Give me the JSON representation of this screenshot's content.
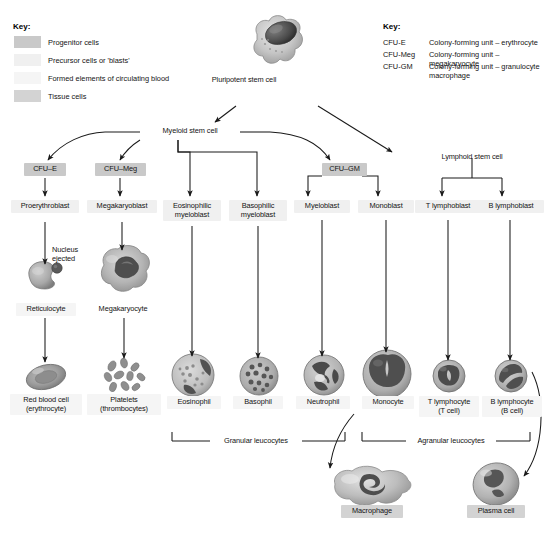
{
  "key_left": {
    "title": "Key:",
    "items": [
      {
        "label": "Progenitor cells",
        "color": "#c9c9c9",
        "swatch": "progenitor-swatch"
      },
      {
        "label": "Precursor cells or 'blasts'",
        "color": "#f0f0f0",
        "swatch": "precursor-swatch"
      },
      {
        "label": "Formed elements of circulating blood",
        "color": "#f5f5f5",
        "swatch": "formed-elements-swatch"
      },
      {
        "label": "Tissue cells",
        "color": "#d3d3d3",
        "swatch": "tissue-swatch"
      }
    ]
  },
  "key_right": {
    "title": "Key:",
    "items": [
      {
        "abbr": "CFU-E",
        "definition": "Colony-forming unit – erythrocyte"
      },
      {
        "abbr": "CFU-Meg",
        "definition": "Colony-forming unit – megakaryocyte"
      },
      {
        "abbr": "CFU-GM",
        "definition": "Colony-forming unit – granulocyte\nmacrophage"
      }
    ]
  },
  "nodes": {
    "pluripotent": "Pluripotent stem cell",
    "myeloid": "Myeloid stem cell",
    "lymphoid": "Lymphoid stem cell",
    "cfu_e": "CFU–E",
    "cfu_meg": "CFU–Meg",
    "cfu_gm": "CFU–GM",
    "proerythroblast": "Proerythroblast",
    "megakaryoblast": "Megakaryoblast",
    "eosinophilic_myeloblast": "Eosinophilic\nmyeloblast",
    "basophilic_myeloblast": "Basophilic\nmyeloblast",
    "myeloblast": "Myeloblast",
    "monoblast": "Monoblast",
    "t_lymphoblast": "T lymphoblast",
    "b_lymphoblast": "B lymphoblast",
    "nucleus_ejected": "Nucleus\nejected",
    "reticulocyte": "Reticulocyte",
    "megakaryocyte": "Megakaryocyte",
    "red_blood_cell": "Red blood cell\n(erythrocyte)",
    "platelets": "Platelets\n(thrombocytes)",
    "eosinophil": "Eosinophil",
    "basophil": "Basophil",
    "neutrophil": "Neutrophil",
    "monocyte": "Monocyte",
    "t_lymphocyte": "T lymphocyte\n(T cell)",
    "b_lymphocyte": "B lymphocyte\n(B cell)",
    "macrophage": "Macrophage",
    "plasma_cell": "Plasma cell"
  },
  "brackets": {
    "granular": "Granular leucocytes",
    "agranular": "Agranular leucocytes"
  }
}
